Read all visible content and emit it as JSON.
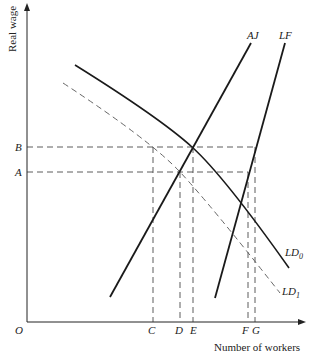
{
  "diagram": {
    "y_axis_label": "Real wage",
    "x_axis_label": "Number of workers",
    "origin_label": "O",
    "y_ticks": [
      {
        "label": "B",
        "y": 147
      },
      {
        "label": "A",
        "y": 172
      }
    ],
    "x_ticks": [
      {
        "label": "C",
        "x": 153
      },
      {
        "label": "D",
        "x": 180
      },
      {
        "label": "E",
        "x": 193
      },
      {
        "label": "F",
        "x": 248
      },
      {
        "label": "G",
        "x": 255
      }
    ],
    "curves": [
      {
        "name": "AJ",
        "label": "AJ",
        "style": "solid"
      },
      {
        "name": "LF",
        "label": "LF",
        "style": "solid"
      },
      {
        "name": "LD0",
        "label_main": "LD",
        "label_sub": "0",
        "style": "solid"
      },
      {
        "name": "LD1",
        "label_main": "LD",
        "label_sub": "1",
        "style": "dashed"
      }
    ],
    "colors": {
      "line": "#1a1a1a",
      "dashed": "#444444",
      "background": "#ffffff"
    }
  }
}
